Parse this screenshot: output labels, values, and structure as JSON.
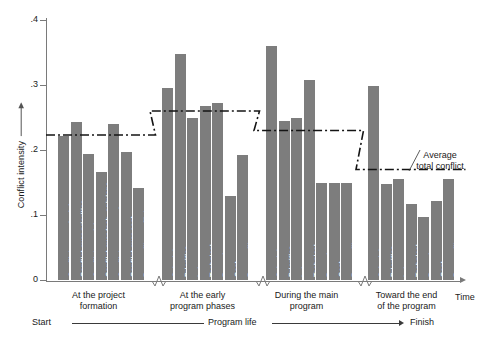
{
  "chart_data": {
    "type": "bar",
    "title": "",
    "xlabel": "Time",
    "ylabel": "Conflict intensity",
    "ylim": [
      0,
      0.4
    ],
    "yticks": [
      0,
      0.1,
      0.2,
      0.3,
      0.4
    ],
    "ytick_labels": [
      "0",
      ".1",
      ".2",
      ".3",
      ".4"
    ],
    "grid": false,
    "legend": "none",
    "categories": [
      "Schedules",
      "Priorities",
      "Labor",
      "Technical",
      "Procedures",
      "Cost",
      "Personality"
    ],
    "groups": [
      {
        "caption_line1": "At the project",
        "caption_line2": "formation",
        "bar_labels": [
          "Conflict over schedules",
          "Conflict over priorities",
          "Conflict over labor",
          "Conflict over tech. opinions",
          "Conflict over procedures",
          "Conflict over cost",
          "Personality conflict"
        ],
        "values": [
          0.222,
          0.243,
          0.194,
          0.166,
          0.24,
          0.197,
          0.142
        ],
        "average": 0.223
      },
      {
        "caption_line1": "At the early",
        "caption_line2": "program phases",
        "bar_labels": [
          "Schedules",
          "Priorities",
          "Labor",
          "Technical",
          "Procedures",
          "Cost",
          "Personality"
        ],
        "values": [
          0.296,
          0.348,
          0.25,
          0.268,
          0.273,
          0.13,
          0.192
        ],
        "average": 0.26
      },
      {
        "caption_line1": "During the main",
        "caption_line2": "program",
        "bar_labels": [
          "Schedules",
          "Priorities",
          "Labor",
          "Technical",
          "Procedures",
          "Cost",
          "Personality"
        ],
        "values": [
          0.36,
          0.245,
          0.25,
          0.308,
          0.149,
          0.149,
          0.149
        ],
        "average": 0.23
      },
      {
        "caption_line1": "Toward the end",
        "caption_line2": "of the program",
        "bar_labels": [
          "Schedules",
          "Priorities",
          "Labor",
          "Technical",
          "Procedures",
          "Cost",
          "Personality"
        ],
        "values": [
          0.298,
          0.148,
          0.156,
          0.117,
          0.097,
          0.121,
          0.156
        ],
        "average": 0.17
      }
    ],
    "annotation": {
      "line1": "Average",
      "line2": "total conflict"
    },
    "footer": {
      "start": "Start",
      "middle": "Program life",
      "finish": "Finish"
    },
    "colors": {
      "bar": "#7d7d7d",
      "axis": "#7a7a7a",
      "average_line": "#141414",
      "text": "#1a1a1a"
    }
  }
}
